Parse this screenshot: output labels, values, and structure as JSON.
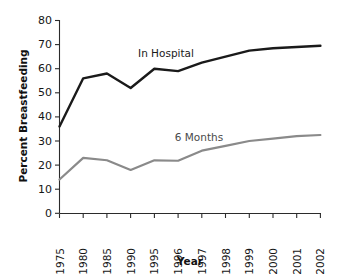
{
  "chart_data": {
    "type": "line",
    "title": "",
    "subtitle": "",
    "xlabel": "Year",
    "ylabel": "Percent Breastfeeding",
    "categories": [
      "1975",
      "1980",
      "1985",
      "1990",
      "1995",
      "1996",
      "1997",
      "1998",
      "1999",
      "2000",
      "2001",
      "2002"
    ],
    "series": [
      {
        "name": "In Hospital",
        "color": "#1a1a1a",
        "values": [
          36,
          56,
          58,
          52,
          60,
          59,
          62.5,
          65,
          67.5,
          68.5,
          69,
          69.5
        ]
      },
      {
        "name": "6 Months",
        "color": "#8a8a8a",
        "values": [
          14,
          23,
          22,
          18,
          22,
          21.8,
          26,
          28,
          30,
          31,
          32,
          32.5
        ]
      }
    ],
    "ylim": [
      0,
      80
    ],
    "ytick_values": [
      "0",
      "10",
      "20",
      "30",
      "40",
      "50",
      "60",
      "70",
      "80"
    ],
    "xtick_labels": [
      "1975",
      "1980",
      "1985",
      "1990",
      "1995",
      "1996",
      "1997",
      "1998",
      "1999",
      "2000",
      "2001",
      "2002"
    ],
    "grid": false,
    "legend_position": "inline-annotations",
    "annotations": [
      {
        "text": "In Hospital",
        "series": "In Hospital"
      },
      {
        "text": "6 Months",
        "series": "6 Months"
      }
    ]
  }
}
